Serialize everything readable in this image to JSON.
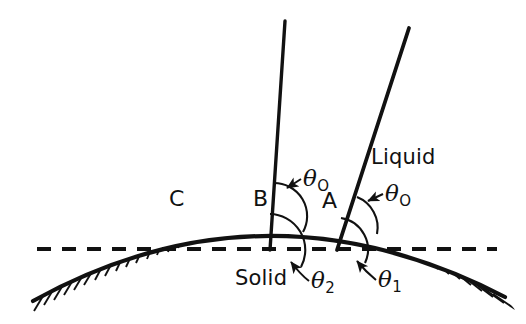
{
  "figure": {
    "type": "diagram",
    "background_color": "#ffffff",
    "ink_color": "#111111"
  },
  "labels": {
    "point_c": "C",
    "point_b": "B",
    "point_a": "A",
    "theta_zero_b": "θ",
    "theta_zero_b_sub": "O",
    "theta_zero_a": "θ",
    "theta_zero_a_sub": "O",
    "theta_two": "θ",
    "theta_two_sub": "2",
    "theta_one": "θ",
    "theta_one_sub": "1",
    "solid": "Solid",
    "liquid": "Liquid"
  },
  "geometry": {
    "solid_curve": {
      "description": "convex solid surface, hatched on the underside",
      "path": "M 33 301 Q 265 173 505 297",
      "stroke_width": 4.2,
      "hatch_count": 46,
      "hatch_length": 15
    },
    "reference_line": {
      "description": "horizontal dashed reference line",
      "x_start": 37,
      "x_end": 497,
      "y": 249,
      "dash": "14 11",
      "stroke_width": 4.2
    },
    "line_b": {
      "description": "liquid interface line through point B",
      "x1": 285,
      "y1": 21,
      "x2": 270,
      "y2": 250,
      "stroke_width": 3.4
    },
    "line_a": {
      "description": "liquid interface line through point A",
      "x1": 409,
      "y1": 28,
      "x2": 337,
      "y2": 250,
      "stroke_width": 3.8
    },
    "arc_theta_zero_b": {
      "cx": 273,
      "cy": 216,
      "r": 33
    },
    "arc_theta_zero_a": {
      "cx": 345,
      "cy": 228,
      "r": 33
    },
    "arc_theta_two": {
      "cx": 270,
      "cy": 250,
      "r": 36
    },
    "arc_theta_one": {
      "cx": 337,
      "cy": 250,
      "r": 32
    }
  }
}
